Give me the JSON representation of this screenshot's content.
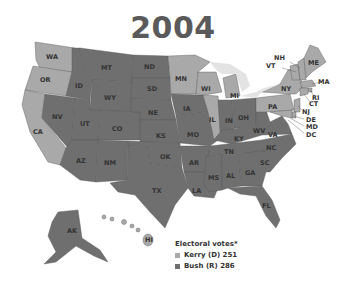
{
  "title": "2004",
  "legend": {
    "heading": "Electoral votes*",
    "items": [
      {
        "label": "Kerry (D) 251",
        "color": "#a9a9a9"
      },
      {
        "label": "Bush (R) 286",
        "color": "#6f6f6f"
      }
    ]
  },
  "colors": {
    "democrat": "#a9a9a9",
    "republican": "#6f6f6f",
    "lakes": "#e3e3e3"
  },
  "states": {
    "kerry": [
      "WA",
      "OR",
      "CA",
      "MN",
      "WI",
      "IL",
      "MI",
      "PA",
      "NY",
      "VT",
      "NH",
      "ME",
      "MA",
      "RI",
      "CT",
      "NJ",
      "DE",
      "MD",
      "DC",
      "HI"
    ],
    "bush": [
      "ID",
      "MT",
      "WY",
      "NV",
      "UT",
      "CO",
      "AZ",
      "NM",
      "ND",
      "SD",
      "NE",
      "KS",
      "OK",
      "TX",
      "IA",
      "MO",
      "AR",
      "LA",
      "IN",
      "OH",
      "KY",
      "WV",
      "VA",
      "TN",
      "NC",
      "SC",
      "MS",
      "AL",
      "GA",
      "FL",
      "AK"
    ]
  },
  "labels": {
    "WA": "WA",
    "OR": "OR",
    "CA": "CA",
    "ID": "ID",
    "NV": "NV",
    "MT": "MT",
    "WY": "WY",
    "UT": "UT",
    "AZ": "AZ",
    "CO": "CO",
    "NM": "NM",
    "ND": "ND",
    "SD": "SD",
    "NE": "NE",
    "KS": "KS",
    "OK": "OK",
    "TX": "TX",
    "MN": "MN",
    "IA": "IA",
    "MO": "MO",
    "AR": "AR",
    "LA": "LA",
    "WI": "WI",
    "IL": "IL",
    "MI": "MI",
    "IN": "IN",
    "OH": "OH",
    "KY": "KY",
    "TN": "TN",
    "MS": "MS",
    "AL": "AL",
    "GA": "GA",
    "FL": "FL",
    "SC": "SC",
    "NC": "NC",
    "VA": "VA",
    "WV": "WV",
    "PA": "PA",
    "NY": "NY",
    "VT": "VT",
    "NH": "NH",
    "ME": "ME",
    "MA": "MA",
    "RI": "RI",
    "CT": "CT",
    "NJ": "NJ",
    "DE": "DE",
    "MD": "MD",
    "DC": "DC",
    "AK": "AK",
    "HI": "HI"
  }
}
